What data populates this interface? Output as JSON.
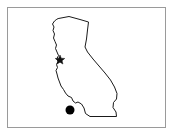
{
  "figure": {
    "title": "California state outline map",
    "caption": "",
    "background_color": "#ffffff",
    "frame_color": "#9a9a9a",
    "outline_color": "#1a1a1a",
    "marker_color": "#000000"
  },
  "map": {
    "region_name": "California",
    "region_label": "",
    "outline_label": "california-state-boundary",
    "projection_note": ""
  },
  "markers": [
    {
      "name": "bay-area-marker",
      "label": "",
      "shape": "star",
      "x": 60,
      "y": 60,
      "color": "#111111",
      "size": 5
    },
    {
      "name": "southern-city-dot",
      "label": "",
      "shape": "circle",
      "x": 70,
      "y": 110,
      "color": "#000000",
      "size": 4.5
    }
  ],
  "legend": {
    "visible": false,
    "entries": []
  }
}
